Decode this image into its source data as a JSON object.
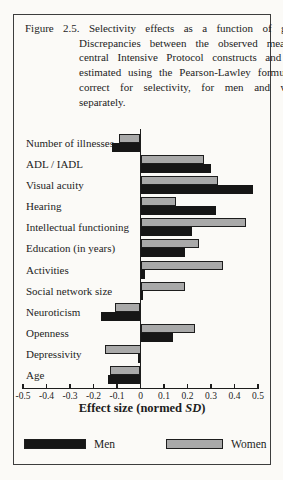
{
  "figure": {
    "caption_label": "Figure 2.5.",
    "caption_text": "Selectivity effects as a function of gender. Discrepancies between the observed means of central Intensive Protocol constructs and those estimated using the Pearson-Lawley formulae to correct for selectivity, for men and women separately."
  },
  "chart_data": {
    "type": "bar",
    "orientation": "horizontal",
    "categories": [
      "Number of illnesses",
      "ADL / IADL",
      "Visual acuity",
      "Hearing",
      "Intellectual functioning",
      "Education (in years)",
      "Activities",
      "Social network size",
      "Neuroticism",
      "Openness",
      "Depressivity",
      "Age"
    ],
    "series": [
      {
        "name": "Men",
        "color": "#161616",
        "values": [
          -0.12,
          0.3,
          0.48,
          0.32,
          0.22,
          0.19,
          0.02,
          0.01,
          -0.17,
          0.14,
          -0.01,
          -0.14
        ]
      },
      {
        "name": "Women",
        "color": "#a9a9a9",
        "values": [
          -0.09,
          0.27,
          0.33,
          0.15,
          0.45,
          0.25,
          0.35,
          0.19,
          -0.11,
          0.23,
          -0.15,
          -0.13
        ]
      }
    ],
    "bar_order_top_to_bottom": [
      "Women",
      "Men"
    ],
    "xlabel": "Effect size (normed SD)",
    "xlabel_parts": {
      "prefix": "Effect size (normed ",
      "italic": "SD",
      "suffix": ")"
    },
    "xlim": [
      -0.5,
      0.5
    ],
    "xticks": [
      -0.5,
      -0.4,
      -0.3,
      -0.2,
      -0.1,
      0,
      0.1,
      0.2,
      0.3,
      0.4,
      0.5
    ],
    "xtick_labels": [
      "-0.5",
      "-0.4",
      "-0.3",
      "-0.2",
      "-0.1",
      "0",
      "0.1",
      "0.2",
      "0.3",
      "0.4",
      "0.5"
    ],
    "grid": false,
    "axis_color": "#1d1d1d",
    "legend": {
      "position": "bottom",
      "items": [
        {
          "label": "Men",
          "color": "#161616"
        },
        {
          "label": "Women",
          "color": "#a9a9a9"
        }
      ]
    }
  }
}
